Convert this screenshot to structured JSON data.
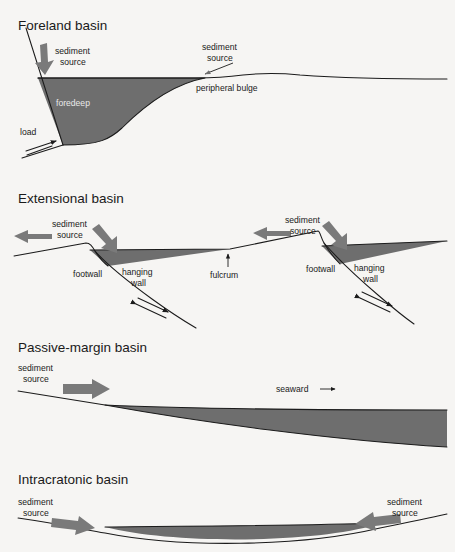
{
  "figure": {
    "background_color": "#f6f5f3",
    "fill_color": "#6e6e6e",
    "line_color": "#1b1b1b",
    "arrow_color": "#7a7a7a"
  },
  "panels": [
    {
      "id": "foreland",
      "title": "Foreland basin",
      "labels": {
        "sediment_source_left": "sediment\nsource",
        "sediment_source_left_line1": "sediment",
        "sediment_source_left_line2": "source",
        "sediment_source_right_line1": "sediment",
        "sediment_source_right_line2": "source",
        "foredeep": "foredeep",
        "peripheral_bulge": "peripheral bulge",
        "load": "load"
      }
    },
    {
      "id": "extensional",
      "title": "Extensional basin",
      "labels": {
        "sediment_source_left_line1": "sediment",
        "sediment_source_left_line2": "source",
        "sediment_source_right_line1": "sediment",
        "sediment_source_right_line2": "source",
        "footwall_left": "footwall",
        "hanging_left_line1": "hanging",
        "hanging_left_line2": "wall",
        "footwall_right": "footwall",
        "hanging_right_line1": "hanging",
        "hanging_right_line2": "wall",
        "fulcrum": "fulcrum"
      }
    },
    {
      "id": "passive-margin",
      "title": "Passive-margin basin",
      "labels": {
        "sediment_source_line1": "sediment",
        "sediment_source_line2": "source",
        "seaward": "seaward"
      }
    },
    {
      "id": "intracratonic",
      "title": "Intracratonic basin",
      "labels": {
        "sediment_source_left_line1": "sediment",
        "sediment_source_left_line2": "source",
        "sediment_source_right_line1": "sediment",
        "sediment_source_right_line2": "source"
      }
    }
  ]
}
